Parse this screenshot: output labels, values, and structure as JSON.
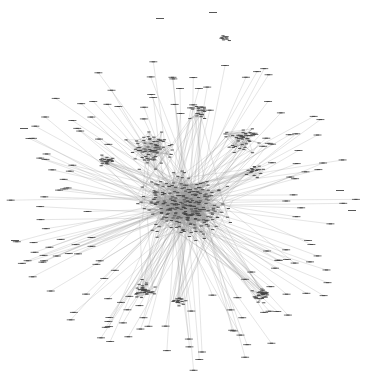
{
  "diagram": {
    "type": "network-graph",
    "width": 379,
    "height": 380,
    "background": "#ffffff",
    "edge_color": "#9a9a9a",
    "node_color": "#444444",
    "hub": {
      "x": 185,
      "y": 205,
      "rx": 60,
      "ry": 35
    },
    "clusters": [
      {
        "name": "core",
        "x": 185,
        "y": 205,
        "r": 55,
        "nodes": 260
      },
      {
        "name": "upper-left",
        "x": 150,
        "y": 150,
        "r": 28,
        "nodes": 70
      },
      {
        "name": "upper-right",
        "x": 240,
        "y": 140,
        "r": 22,
        "nodes": 40
      },
      {
        "name": "top-center",
        "x": 200,
        "y": 110,
        "r": 14,
        "nodes": 20
      },
      {
        "name": "left-mid",
        "x": 105,
        "y": 160,
        "r": 14,
        "nodes": 20
      },
      {
        "name": "right-mid",
        "x": 255,
        "y": 170,
        "r": 12,
        "nodes": 18
      },
      {
        "name": "lower-left",
        "x": 145,
        "y": 290,
        "r": 16,
        "nodes": 35
      },
      {
        "name": "lower-center",
        "x": 180,
        "y": 300,
        "r": 10,
        "nodes": 15
      },
      {
        "name": "lower-right",
        "x": 262,
        "y": 295,
        "r": 14,
        "nodes": 30
      },
      {
        "name": "detached-top",
        "x": 225,
        "y": 38,
        "r": 7,
        "nodes": 10
      }
    ],
    "peripheral_nodes": 170,
    "isolated_labels": [
      {
        "x": 160,
        "y": 18
      },
      {
        "x": 213,
        "y": 12
      },
      {
        "x": 24,
        "y": 128
      },
      {
        "x": 15,
        "y": 240
      },
      {
        "x": 352,
        "y": 210
      },
      {
        "x": 340,
        "y": 190
      }
    ],
    "labels_legible": false
  }
}
